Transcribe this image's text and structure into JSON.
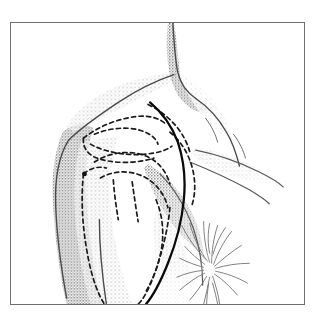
{
  "figure": {
    "domain_label": "anatomical-line-drawing",
    "medium": "pen-and-ink stipple illustration",
    "caption": "",
    "frame": {
      "border_color": "#6f6f72",
      "border_width_px": 1,
      "x": 10,
      "y": 22,
      "width": 295,
      "height": 283,
      "background": "#ffffff"
    },
    "colors": {
      "skin_outline": "#4a4a4a",
      "stipple_shadow": "#8a8a8a",
      "stipple_shadow_light": "#b9b9b9",
      "bone_dashed": "#1a1a1a",
      "incision_solid": "#000000",
      "hair_tuft": "#6a6a6a",
      "paper": "#ffffff"
    },
    "elements": [
      {
        "name": "skin-contour-neck",
        "type": "solid-outline",
        "description": "neck and trapezius border descending from top edge"
      },
      {
        "name": "skin-contour-shoulder",
        "type": "solid-outline",
        "description": "deltoid shoulder cap curving left and down"
      },
      {
        "name": "skin-contour-upper-arm",
        "type": "solid-outline",
        "description": "lateral upper arm running to bottom edge"
      },
      {
        "name": "stipple-shading-deltoid",
        "type": "halftone-shading",
        "description": "graded stipple on lateral deltoid and arm"
      },
      {
        "name": "stipple-shading-axilla",
        "type": "halftone-shading",
        "description": "stipple shading in axillary fold"
      },
      {
        "name": "bone-outline-clavicle",
        "type": "dashed-outline",
        "description": "clavicle projected beneath skin"
      },
      {
        "name": "bone-outline-acromion",
        "type": "dashed-outline",
        "description": "acromion process of scapula"
      },
      {
        "name": "bone-outline-scapular-spine",
        "type": "dashed-outline",
        "description": "spine of scapula"
      },
      {
        "name": "bone-outline-humeral-head",
        "type": "dashed-outline",
        "description": "head of humerus / glenohumeral joint"
      },
      {
        "name": "bone-outline-humerus-shaft",
        "type": "dashed-outline",
        "description": "proximal humeral shaft and tuberosities"
      },
      {
        "name": "bone-outline-coracoid",
        "type": "dashed-outline",
        "description": "coracoid process marked by a dot"
      },
      {
        "name": "landmark-dot-coracoid",
        "type": "dot-marker",
        "description": "filled dot marking coracoid tip"
      },
      {
        "name": "incision-line",
        "type": "solid-line",
        "description": "deltopectoral surgical incision line from clavicle to arm"
      },
      {
        "name": "axillary-hair",
        "type": "hatching-tuft",
        "description": "axillary hair tuft at lower right"
      },
      {
        "name": "pectoral-fold",
        "type": "solid-outline",
        "description": "pectoralis major border and anterior axillary fold"
      }
    ]
  }
}
